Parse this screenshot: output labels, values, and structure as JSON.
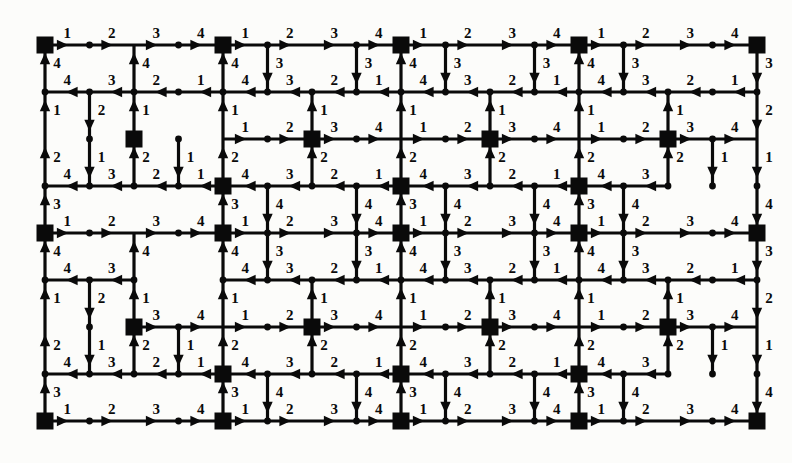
{
  "figure": {
    "kind": "directed-grid-graph",
    "background_color": "#fcfcfa",
    "ink_color": "#0a0a0a"
  },
  "geometry": {
    "width": 792,
    "height": 463,
    "origin_x": 45,
    "origin_y": 45,
    "col_step": 44.5,
    "row_step": 47.0,
    "n_cols": 17,
    "n_rows": 9,
    "square_size": 17,
    "dot_radius": 3.4,
    "edge_width": 3.2,
    "arrow_len": 10,
    "arrow_half_width": 5.2
  },
  "nodes": {
    "square_node_name": "square-hub-node",
    "dot_node_name": "dot-node",
    "square_cols": [
      0,
      4,
      8,
      12,
      16
    ],
    "square_rows": [
      0,
      4,
      8
    ],
    "extra_squares": [
      {
        "col": 2,
        "row": 2
      },
      {
        "col": 6,
        "row": 2
      },
      {
        "col": 10,
        "row": 2
      },
      {
        "col": 14,
        "row": 2
      },
      {
        "col": 2,
        "row": 6
      },
      {
        "col": 6,
        "row": 6
      },
      {
        "col": 10,
        "row": 6
      },
      {
        "col": 14,
        "row": 6
      },
      {
        "col": 4,
        "row": 3
      },
      {
        "col": 8,
        "row": 3
      },
      {
        "col": 12,
        "row": 3
      },
      {
        "col": 4,
        "row": 7
      },
      {
        "col": 8,
        "row": 7
      },
      {
        "col": 12,
        "row": 7
      }
    ],
    "dot_cols_odd": true
  },
  "edges": {
    "horizontal_label_cycle": [
      "1",
      "2",
      "3",
      "4"
    ],
    "horizontal_label_cycle_rev": [
      "4",
      "3",
      "2",
      "1"
    ],
    "vertical_label_cycle_down": [
      "3",
      "2",
      "1",
      "4"
    ],
    "vertical_label_cycle_up": [
      "4",
      "1",
      "2",
      "3"
    ],
    "row_directions": [
      "right",
      "left",
      "right",
      "left",
      "right",
      "left",
      "right",
      "left",
      "right"
    ],
    "col_directions": [
      "up",
      "down",
      "up",
      "down",
      "up",
      "down",
      "up",
      "down",
      "up",
      "down",
      "up",
      "down",
      "up",
      "down",
      "up",
      "down",
      "down"
    ],
    "missing_vertical": [
      {
        "col": 1,
        "rows": [
          0,
          3,
          4,
          7
        ]
      },
      {
        "col": 2,
        "rows": [
          3,
          7
        ]
      },
      {
        "col": 3,
        "rows": [
          0,
          1,
          3,
          4,
          5,
          7
        ]
      },
      {
        "col": 5,
        "rows": [
          1,
          2,
          5,
          6
        ]
      },
      {
        "col": 6,
        "rows": [
          0,
          3,
          4,
          7
        ]
      },
      {
        "col": 7,
        "rows": [
          1,
          2,
          5,
          6
        ]
      },
      {
        "col": 9,
        "rows": [
          1,
          2,
          5,
          6
        ]
      },
      {
        "col": 10,
        "rows": [
          0,
          3,
          4,
          7
        ]
      },
      {
        "col": 11,
        "rows": [
          1,
          2,
          5,
          6
        ]
      },
      {
        "col": 13,
        "rows": [
          1,
          2,
          5,
          6
        ]
      },
      {
        "col": 14,
        "rows": [
          0,
          3,
          4,
          7
        ]
      },
      {
        "col": 15,
        "rows": [
          0,
          1,
          3,
          4,
          5,
          7
        ]
      }
    ],
    "missing_horizontal": [
      {
        "row": 2,
        "cols": [
          0,
          1,
          2,
          3
        ]
      },
      {
        "row": 6,
        "cols": [
          0,
          1
        ]
      },
      {
        "row": 3,
        "cols": [
          14,
          15
        ]
      },
      {
        "row": 5,
        "cols": [
          2,
          3
        ]
      },
      {
        "row": 1,
        "cols": []
      },
      {
        "row": 7,
        "cols": [
          14,
          15
        ]
      }
    ]
  },
  "labels": {
    "values_used": [
      "1",
      "2",
      "3",
      "4"
    ],
    "top_row_sequence": [
      "1",
      "2",
      "3",
      "4",
      "1",
      "2",
      "3",
      "4",
      "1",
      "2",
      "3",
      "4",
      "1",
      "2",
      "3",
      "4"
    ],
    "bottom_row_sequence": [
      "4",
      "3",
      "2",
      "1",
      "4",
      "3",
      "2",
      "1",
      "4",
      "3",
      "2",
      "1",
      "4",
      "3",
      "2",
      "1"
    ],
    "left_col_sequence": [
      "4",
      "3",
      "2",
      "1",
      "4",
      "3",
      "2",
      "1"
    ],
    "right_col_sequence": [
      "1",
      "2",
      "3",
      "4",
      "1",
      "2",
      "3",
      "4"
    ]
  }
}
